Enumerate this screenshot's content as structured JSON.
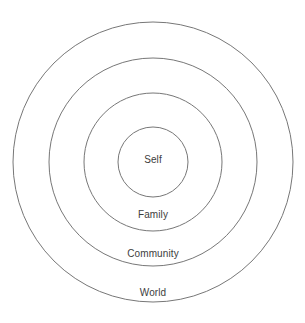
{
  "diagram": {
    "type": "concentric-circles",
    "canvas": {
      "width": 305,
      "height": 323,
      "background": "#ffffff"
    },
    "center": {
      "x": 153,
      "y": 162
    },
    "stroke": {
      "color": "#777777",
      "width": 1,
      "fill": "none"
    },
    "label_color": "#3d3d3d",
    "rings": [
      {
        "key": "world",
        "label": "World",
        "radius": 140,
        "label_x": 153,
        "label_y": 293,
        "order": 4
      },
      {
        "key": "community",
        "label": "Community",
        "radius": 104,
        "label_x": 153,
        "label_y": 254,
        "order": 3
      },
      {
        "key": "family",
        "label": "Family",
        "radius": 69,
        "label_x": 153,
        "label_y": 215,
        "order": 2
      },
      {
        "key": "self",
        "label": "Self",
        "radius": 35,
        "label_x": 153,
        "label_y": 160,
        "order": 1
      }
    ]
  },
  "chart_data": {
    "type": "pie",
    "categories": [
      "Self",
      "Family",
      "Community",
      "World"
    ],
    "values": [
      35,
      69,
      104,
      140
    ],
    "value_meaning": "circle radius in pixels",
    "xlabel": "",
    "ylabel": "",
    "legend": "none",
    "grid": false,
    "annotations": [
      "Self",
      "Family",
      "Community",
      "World"
    ]
  }
}
